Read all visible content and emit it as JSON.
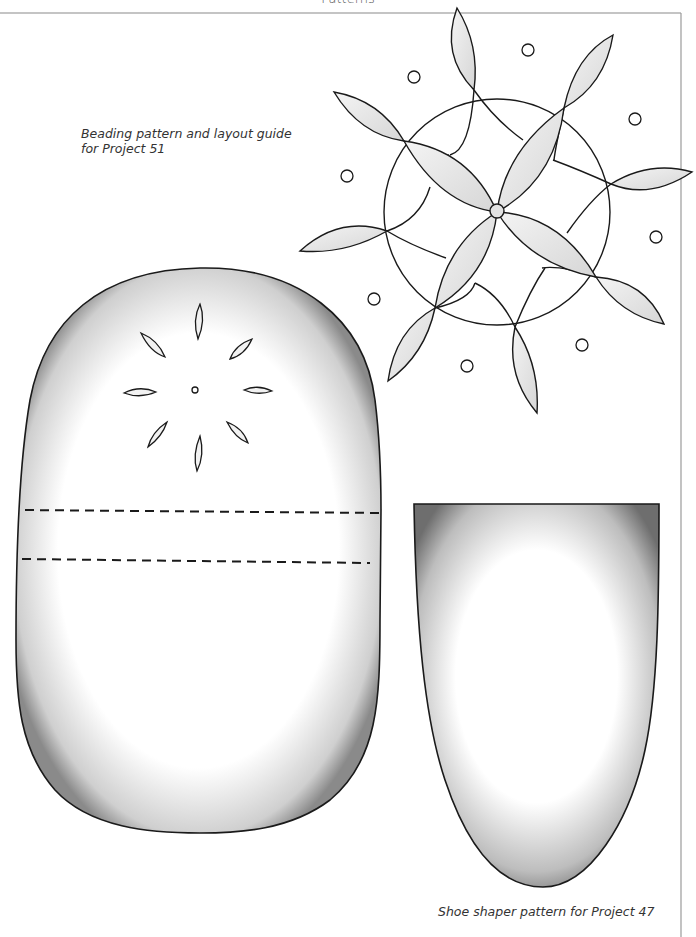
{
  "page": {
    "header": "Patterns",
    "captions": {
      "beading": "Beading pattern and layout guide for Project 51",
      "shoe_shaper": "Shoe shaper pattern for Project 47"
    },
    "figures": [
      {
        "name": "beading-mandala",
        "description": "Circular beading pattern with 8 leaf petals and 8 dots"
      },
      {
        "name": "beading-layout-oval",
        "description": "Rounded oval template with 8-petal flower and two dashed fold lines"
      },
      {
        "name": "shoe-shaper",
        "description": "Shield-shaped shoe shaper template"
      }
    ],
    "colors": {
      "line": "#1a1a1a",
      "shade": "#6e6e6e",
      "border": "#8a8a8a"
    }
  }
}
